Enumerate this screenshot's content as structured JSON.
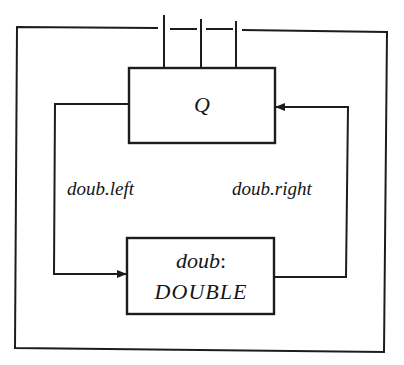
{
  "diagram": {
    "type": "block-diagram",
    "colors": {
      "line": "#1c1c1c",
      "text": "#151515",
      "background": "#ffffff"
    },
    "outer_frame": {
      "label": "",
      "top_ports": 3
    },
    "nodes": {
      "q": {
        "label": "Q"
      },
      "doub": {
        "name": "doub",
        "separator": ":",
        "type": "DOUBLE"
      }
    },
    "edges": {
      "left": {
        "label": "doub.left",
        "from": "q",
        "to": "doub"
      },
      "right": {
        "label": "doub.right",
        "from": "doub",
        "to": "q"
      }
    }
  }
}
